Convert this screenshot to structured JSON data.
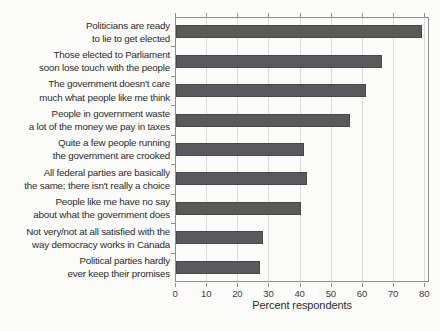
{
  "figure": {
    "xlabel": "Percent respondents"
  },
  "colors": {
    "background": "#fbfbf9",
    "bar_fill": "#5a5a5c",
    "bar_edge": "#47474a",
    "gridline": "#dcdcda",
    "axis_frame": "#8f8f8f",
    "label_text": "#2c2c2c"
  },
  "chart_data": {
    "type": "bar",
    "orientation": "horizontal",
    "title": "",
    "xlabel": "Percent respondents",
    "ylabel": "",
    "xlim": [
      0,
      81
    ],
    "x_ticks": [
      0,
      10,
      20,
      30,
      40,
      50,
      60,
      70,
      80
    ],
    "grid": "vertical gridlines at every 10 units",
    "legend": "none",
    "categories": [
      "Politicians are ready to lie to get elected",
      "Those elected to Parliament soon lose touch with the people",
      "The government doesn't care much what people like me think",
      "People in government waste a lot of the money we pay in taxes",
      "Quite a few people running the government are crooked",
      "All federal parties are basically the same; there isn't really a choice",
      "People like me have no say about what the government does",
      "Not very/not at all satisfied with the way democracy works in Canada",
      "Political parties hardly ever keep their promises"
    ],
    "label_lines": [
      [
        "Politicians are ready",
        "to lie to get elected"
      ],
      [
        "Those elected to Parliament",
        "soon lose touch with the people"
      ],
      [
        "The government doesn't care",
        "much what people like me think"
      ],
      [
        "People in government waste",
        "a lot of the money we pay in taxes"
      ],
      [
        "Quite a few people running",
        "the government are crooked"
      ],
      [
        "All federal parties are basically",
        "the same; there isn't really a choice"
      ],
      [
        "People like me have no say",
        "about what the government does"
      ],
      [
        "Not very/not at all satisfied with the",
        "way democracy works in Canada"
      ],
      [
        "Political parties hardly",
        "ever keep their promises"
      ]
    ],
    "values": [
      79,
      66,
      61,
      56,
      41,
      42,
      40,
      28,
      27
    ]
  }
}
